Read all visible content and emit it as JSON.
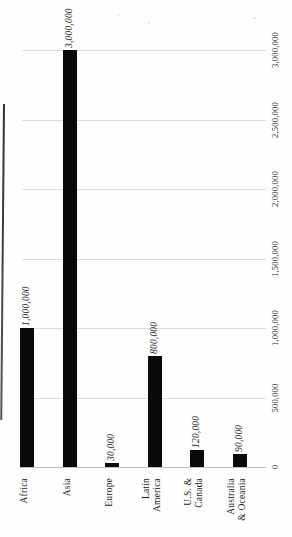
{
  "chart_data": {
    "type": "bar",
    "title": "",
    "orientation": "page scanned sideways: bars vertical, all text rotated 90deg CCW (reads bottom-to-top), value axis on right edge",
    "categories": [
      "Africa",
      "Asia",
      "Europe",
      "Latin America",
      "U.S. & Canada",
      "Australia & Oceania"
    ],
    "category_lines": [
      [
        "Africa"
      ],
      [
        "Asia"
      ],
      [
        "Europe"
      ],
      [
        "Latin",
        "America"
      ],
      [
        "U.S. &",
        "Canada"
      ],
      [
        "Australia",
        "& Oceania"
      ]
    ],
    "values": [
      1000000,
      3000000,
      30000,
      800000,
      120000,
      90000
    ],
    "data_labels": [
      "1,000,000",
      "3,000,000",
      "30,000",
      "800,000",
      "120,000",
      "90,000"
    ],
    "axis_ticks": [
      "0",
      "500,000",
      "1,000,000",
      "1,500,000",
      "2,000,000",
      "2,500,000",
      "3,000,000"
    ],
    "ylim": [
      0,
      3000000
    ],
    "grid": true,
    "legend": false,
    "colors": {
      "bar": "#0a0a0a",
      "gridline": "#dcdcdc",
      "axis_line": "#c2c2c2",
      "text": "#1c1c1c"
    }
  }
}
